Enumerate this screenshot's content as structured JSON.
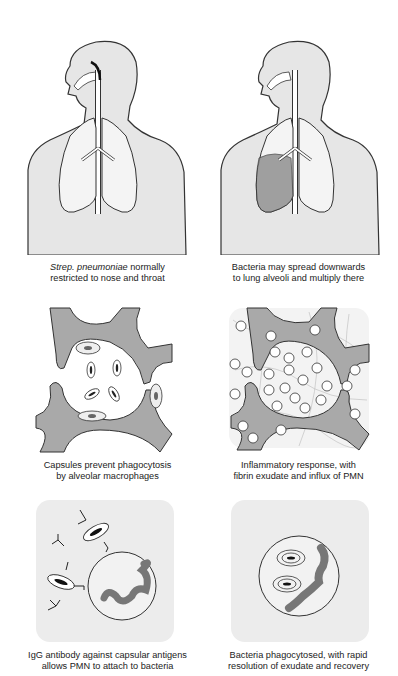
{
  "figure": {
    "layout": {
      "rows": 3,
      "columns": 2
    },
    "colors": {
      "body_fill": "#e6e6e6",
      "outline": "#333333",
      "tissue": "#a9a9a9",
      "panel_bg": "#ececec",
      "infected": "#777777"
    },
    "panels": [
      {
        "id": "nasopharynx",
        "caption_italic": "Strep. pneumoniae",
        "caption_line1_rest": " normally",
        "caption_line2": "restricted to nose and throat"
      },
      {
        "id": "lung-spread",
        "caption_line1": "Bacteria may spread downwards",
        "caption_line2": "to lung alveoli and multiply there"
      },
      {
        "id": "capsules",
        "caption_line1": "Capsules prevent phagocytosis",
        "caption_line2": "by alveolar macrophages"
      },
      {
        "id": "inflammation",
        "caption_line1": "Inflammatory response, with",
        "caption_line2": "fibrin exudate and influx of PMN"
      },
      {
        "id": "igg-antibody",
        "caption_line1": "IgG antibody against capsular antigens",
        "caption_line2": "allows PMN to attach to bacteria"
      },
      {
        "id": "phagocytosed",
        "caption_line1": "Bacteria phagocytosed, with rapid",
        "caption_line2": "resolution of exudate and recovery"
      }
    ]
  }
}
